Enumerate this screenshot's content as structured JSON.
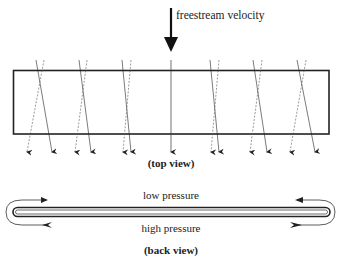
{
  "top_view": {
    "freestream_label": "freestream velocity",
    "caption": "(top view)",
    "vortex_pairs": [
      {
        "top": [
          36,
          44
        ],
        "bottom": [
          27,
          52
        ]
      },
      {
        "top": [
          79,
          87
        ],
        "bottom": [
          75,
          91
        ]
      },
      {
        "top": [
          122,
          131
        ],
        "bottom": [
          123,
          131
        ]
      },
      {
        "top": [
          210,
          219
        ],
        "bottom": [
          211,
          219
        ]
      },
      {
        "top": [
          253,
          262
        ],
        "bottom": [
          250,
          267
        ]
      },
      {
        "top": [
          297,
          306
        ],
        "bottom": [
          290,
          315
        ]
      }
    ],
    "center_line_x": 171
  },
  "back_view": {
    "low_pressure_label": "low pressure",
    "high_pressure_label": "high pressure",
    "caption": "(back view)"
  },
  "colors": {
    "stroke": "#222222",
    "dashed": "#555555"
  }
}
